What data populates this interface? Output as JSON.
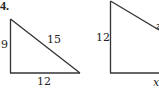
{
  "problem": {
    "number": "4.",
    "figure_a": {
      "side_left": "9",
      "hypotenuse": "15",
      "side_bottom": "12"
    },
    "figure_b": {
      "side_left": "12",
      "side_bottom": "x",
      "hypotenuse_partial": "z"
    }
  }
}
